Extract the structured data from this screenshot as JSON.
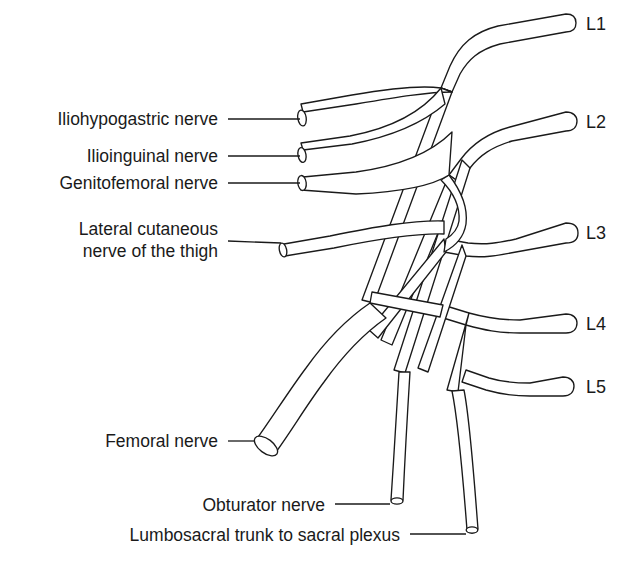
{
  "figure": {
    "background_color": "#ffffff",
    "line_color": "#1a1a1a",
    "width": 632,
    "height": 570
  },
  "labels": {
    "left": [
      {
        "id": "iliohypogastric",
        "text": "Iliohypogastric nerve",
        "x": 218,
        "y": 119
      },
      {
        "id": "ilioinguinal",
        "text": "Ilioinguinal nerve",
        "x": 218,
        "y": 156
      },
      {
        "id": "genitofemoral",
        "text": "Genitofemoral nerve",
        "x": 218,
        "y": 183
      },
      {
        "id": "femoral",
        "text": "Femoral nerve",
        "x": 218,
        "y": 441
      }
    ],
    "lateral_cutaneous": {
      "id": "lateral-cutaneous",
      "line1": "Lateral cutaneous",
      "line2": "nerve of the thigh",
      "x": 218,
      "y": 241
    },
    "bottom": [
      {
        "id": "obturator",
        "text": "Obturator nerve",
        "x": 325,
        "y": 505
      },
      {
        "id": "lumbosacral",
        "text": "Lumbosacral trunk to sacral plexus",
        "x": 400,
        "y": 535
      }
    ],
    "roots": [
      {
        "id": "L1",
        "text": "L1",
        "x": 586,
        "y": 25
      },
      {
        "id": "L2",
        "text": "L2",
        "x": 586,
        "y": 123
      },
      {
        "id": "L3",
        "text": "L3",
        "x": 586,
        "y": 234
      },
      {
        "id": "L4",
        "text": "L4",
        "x": 586,
        "y": 325
      },
      {
        "id": "L5",
        "text": "L5",
        "x": 586,
        "y": 388
      }
    ]
  },
  "leaders": [
    {
      "id": "leader-iliohypogastric",
      "x1": 228,
      "y1": 119,
      "x2": 300,
      "y2": 119
    },
    {
      "id": "leader-ilioinguinal",
      "x1": 228,
      "y1": 156,
      "x2": 300,
      "y2": 156
    },
    {
      "id": "leader-genitofemoral",
      "x1": 228,
      "y1": 183,
      "x2": 300,
      "y2": 183
    },
    {
      "id": "leader-lateral-cutaneous",
      "x1": 228,
      "y1": 241,
      "x2": 281,
      "y2": 241
    },
    {
      "id": "leader-femoral",
      "x1": 228,
      "y1": 441,
      "x2": 250,
      "y2": 441
    },
    {
      "id": "leader-obturator",
      "x1": 335,
      "y1": 505,
      "x2": 389,
      "y2": 505
    },
    {
      "id": "leader-lumbosacral",
      "x1": 410,
      "y1": 535,
      "x2": 466,
      "y2": 535
    }
  ]
}
